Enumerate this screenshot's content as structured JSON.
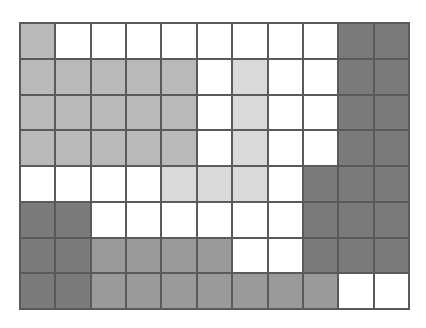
{
  "grid": {
    "rows": 8,
    "cols": 11,
    "shade_colors": {
      "0": "#ffffff",
      "1": "#d9d9d9",
      "2": "#b9b9b9",
      "3": "#9a9a9a",
      "4": "#7b7b7b"
    },
    "cells": [
      [
        2,
        0,
        0,
        0,
        0,
        0,
        0,
        0,
        0,
        4,
        4
      ],
      [
        2,
        2,
        2,
        2,
        2,
        0,
        1,
        0,
        0,
        4,
        4
      ],
      [
        2,
        2,
        2,
        2,
        2,
        0,
        1,
        0,
        0,
        4,
        4
      ],
      [
        2,
        2,
        2,
        2,
        2,
        0,
        1,
        0,
        0,
        4,
        4
      ],
      [
        0,
        0,
        0,
        0,
        1,
        1,
        1,
        0,
        4,
        4,
        4
      ],
      [
        4,
        4,
        0,
        0,
        0,
        0,
        0,
        0,
        4,
        4,
        4
      ],
      [
        4,
        4,
        3,
        3,
        3,
        3,
        0,
        0,
        4,
        4,
        4
      ],
      [
        4,
        4,
        3,
        3,
        3,
        3,
        3,
        3,
        3,
        0,
        0
      ]
    ]
  }
}
